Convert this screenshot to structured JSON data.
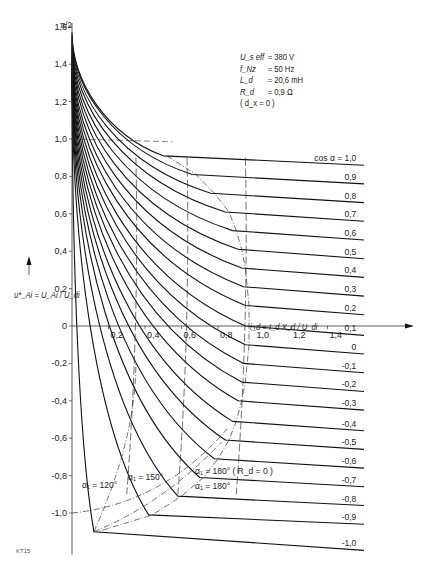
{
  "chart_data": {
    "type": "line",
    "title": "",
    "xlabel": "i_d = I_d X_d / U_di",
    "ylabel": "u*_Ai = U_Ai / U_di",
    "xlim": [
      0,
      1.6
    ],
    "ylim": [
      -1.15,
      1.6
    ],
    "grid": false,
    "x_ticks": [
      "0,2",
      "0,4",
      "0,6",
      "0,8",
      "1,0",
      "1,2",
      "1,4"
    ],
    "y_ticks": [
      "1,6",
      "1,4",
      "1,2",
      "1,0",
      "0,8",
      "0,6",
      "0,4",
      "0,2",
      "0",
      "-0,2",
      "-0,4",
      "-0,6",
      "-0,8",
      "-1,0"
    ],
    "y_top_marker": "π/2",
    "parameters": [
      {
        "key": "U_s eff",
        "value": "= 380 V"
      },
      {
        "key": "f_Nz",
        "value": "= 50 Hz"
      },
      {
        "key": "L_d",
        "value": "= 20,6 mH"
      },
      {
        "key": "R_d",
        "value": "= 0,9 Ω"
      },
      {
        "key": "( d_x = 0 )",
        "value": ""
      }
    ],
    "series_label_prefix": "cos α =",
    "series": [
      {
        "name": "1,0",
        "cos_alpha": 1.0,
        "knee": [
          0.5,
          0.91
        ],
        "end_y": 0.86
      },
      {
        "name": "0,9",
        "cos_alpha": 0.9,
        "knee": [
          0.66,
          0.81
        ],
        "end_y": 0.76
      },
      {
        "name": "0,8",
        "cos_alpha": 0.8,
        "knee": [
          0.76,
          0.71
        ],
        "end_y": 0.66
      },
      {
        "name": "0,7",
        "cos_alpha": 0.7,
        "knee": [
          0.84,
          0.61
        ],
        "end_y": 0.56
      },
      {
        "name": "0,6",
        "cos_alpha": 0.6,
        "knee": [
          0.88,
          0.51
        ],
        "end_y": 0.46
      },
      {
        "name": "0,5",
        "cos_alpha": 0.5,
        "knee": [
          0.91,
          0.41
        ],
        "end_y": 0.36
      },
      {
        "name": "0,4",
        "cos_alpha": 0.4,
        "knee": [
          0.93,
          0.31
        ],
        "end_y": 0.26
      },
      {
        "name": "0,3",
        "cos_alpha": 0.3,
        "knee": [
          0.94,
          0.21
        ],
        "end_y": 0.16
      },
      {
        "name": "0,2",
        "cos_alpha": 0.2,
        "knee": [
          0.95,
          0.11
        ],
        "end_y": 0.06
      },
      {
        "name": "0,1",
        "cos_alpha": 0.1,
        "knee": [
          0.95,
          0.0
        ],
        "end_y": -0.05
      },
      {
        "name": "0",
        "cos_alpha": 0.0,
        "knee": [
          0.95,
          -0.1
        ],
        "end_y": -0.15
      },
      {
        "name": "-0,1",
        "cos_alpha": -0.1,
        "knee": [
          0.94,
          -0.2
        ],
        "end_y": -0.25
      },
      {
        "name": "-0,2",
        "cos_alpha": -0.2,
        "knee": [
          0.93,
          -0.3
        ],
        "end_y": -0.35
      },
      {
        "name": "-0,3",
        "cos_alpha": -0.3,
        "knee": [
          0.91,
          -0.4
        ],
        "end_y": -0.45
      },
      {
        "name": "-0,4",
        "cos_alpha": -0.4,
        "knee": [
          0.88,
          -0.51
        ],
        "end_y": -0.56
      },
      {
        "name": "-0,5",
        "cos_alpha": -0.5,
        "knee": [
          0.84,
          -0.61
        ],
        "end_y": -0.66
      },
      {
        "name": "-0,6",
        "cos_alpha": -0.6,
        "knee": [
          0.78,
          -0.71
        ],
        "end_y": -0.76
      },
      {
        "name": "-0,7",
        "cos_alpha": -0.7,
        "knee": [
          0.7,
          -0.81
        ],
        "end_y": -0.86
      },
      {
        "name": "-0,8",
        "cos_alpha": -0.8,
        "knee": [
          0.58,
          -0.91
        ],
        "end_y": -0.96
      },
      {
        "name": "-0,9",
        "cos_alpha": -0.9,
        "knee": [
          0.42,
          -1.01
        ],
        "end_y": -1.06
      },
      {
        "name": "-1,0",
        "cos_alpha": -1.0,
        "knee": [
          0.12,
          -1.1
        ],
        "end_y": -1.2
      }
    ],
    "boundary_curves": [
      {
        "label": "α₁ = 120°",
        "style": "dash-dot"
      },
      {
        "label": "α₁ = 150°",
        "style": "dash-dot"
      },
      {
        "label": "α₁ = 180°",
        "style": "dash-dot"
      },
      {
        "label": "α₁ = 180° ( R_d = 0 )",
        "style": "dash-dot"
      }
    ],
    "vertical_dashed_lines_x": [
      0.35,
      0.63,
      0.95
    ],
    "figure_code": "KT15"
  }
}
